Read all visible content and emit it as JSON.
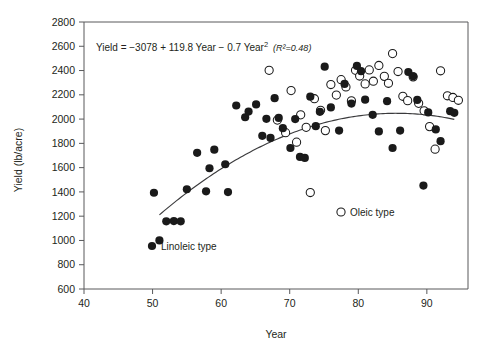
{
  "chart_data": {
    "type": "scatter",
    "title": "",
    "xlabel": "Year",
    "ylabel": "Yield (lb/acre)",
    "xlim": [
      40,
      96
    ],
    "ylim": [
      600,
      2800
    ],
    "xticks": [
      40,
      50,
      60,
      70,
      80,
      90
    ],
    "yticks": [
      600,
      800,
      1000,
      1200,
      1400,
      1600,
      1800,
      2000,
      2200,
      2400,
      2600,
      2800
    ],
    "grid": false,
    "annotation": {
      "equation": "Yield = −3078 + 119.8 Year − 0.7 Year",
      "equation_exponent": "2",
      "r_squared": "(R²=0.48)"
    },
    "legend": {
      "position": "inside-plot",
      "entries": [
        {
          "label": "Linoleic type",
          "marker": "filled-circle",
          "color": "#1a1a1a"
        },
        {
          "label": "Oleic type",
          "marker": "open-circle",
          "color": "#1a1a1a"
        }
      ]
    },
    "fit_curve": {
      "name": "Quadratic fit",
      "form": "quadratic",
      "intercept": -3078,
      "linear_coef": 119.8,
      "quadratic_coef": -0.7,
      "r_squared": 0.48,
      "x_start": 51,
      "x_end": 94
    },
    "series": [
      {
        "name": "Linoleic type",
        "marker": "filled-circle",
        "points": [
          [
            50.2,
            1393
          ],
          [
            51.0,
            1000
          ],
          [
            52.0,
            1158
          ],
          [
            53.1,
            1160
          ],
          [
            54.1,
            1158
          ],
          [
            55.0,
            1422
          ],
          [
            56.5,
            1722
          ],
          [
            57.8,
            1405
          ],
          [
            58.3,
            1595
          ],
          [
            59.0,
            1748
          ],
          [
            60.6,
            1628
          ],
          [
            61.0,
            1399
          ],
          [
            62.2,
            2112
          ],
          [
            63.5,
            2015
          ],
          [
            64.0,
            2062
          ],
          [
            65.1,
            2121
          ],
          [
            66.0,
            1862
          ],
          [
            66.6,
            2002
          ],
          [
            67.2,
            1845
          ],
          [
            67.8,
            2172
          ],
          [
            68.4,
            2010
          ],
          [
            69.0,
            1925
          ],
          [
            70.1,
            1762
          ],
          [
            70.8,
            2000
          ],
          [
            71.5,
            1688
          ],
          [
            72.2,
            1680
          ],
          [
            73.0,
            2185
          ],
          [
            73.8,
            1942
          ],
          [
            74.4,
            2060
          ],
          [
            75.1,
            2432
          ],
          [
            76.0,
            2096
          ],
          [
            77.2,
            1905
          ],
          [
            78.0,
            2290
          ],
          [
            79.0,
            2128
          ],
          [
            79.8,
            2438
          ],
          [
            80.4,
            2395
          ],
          [
            81.0,
            2160
          ],
          [
            82.1,
            2035
          ],
          [
            83.0,
            1898
          ],
          [
            84.2,
            2148
          ],
          [
            85.0,
            1762
          ],
          [
            86.1,
            1905
          ],
          [
            87.3,
            2388
          ],
          [
            88.0,
            2352
          ],
          [
            88.6,
            2158
          ],
          [
            89.5,
            1452
          ],
          [
            90.2,
            2055
          ],
          [
            91.3,
            1915
          ],
          [
            92.0,
            1818
          ],
          [
            93.4,
            2065
          ],
          [
            94.0,
            2052
          ]
        ]
      },
      {
        "name": "Oleic type",
        "marker": "open-circle",
        "points": [
          [
            67.0,
            2402
          ],
          [
            68.2,
            1992
          ],
          [
            69.4,
            1888
          ],
          [
            70.2,
            2235
          ],
          [
            71.0,
            1810
          ],
          [
            71.6,
            2035
          ],
          [
            72.4,
            1932
          ],
          [
            73.0,
            1395
          ],
          [
            73.6,
            2168
          ],
          [
            74.5,
            2072
          ],
          [
            75.2,
            1905
          ],
          [
            76.0,
            2285
          ],
          [
            76.8,
            2198
          ],
          [
            77.5,
            2325
          ],
          [
            78.2,
            2265
          ],
          [
            79.0,
            2150
          ],
          [
            79.6,
            2402
          ],
          [
            80.2,
            2355
          ],
          [
            81.0,
            2290
          ],
          [
            81.6,
            2405
          ],
          [
            82.2,
            2312
          ],
          [
            83.0,
            2442
          ],
          [
            83.8,
            2352
          ],
          [
            84.4,
            2295
          ],
          [
            85.0,
            2540
          ],
          [
            85.8,
            2392
          ],
          [
            86.5,
            2188
          ],
          [
            87.2,
            2152
          ],
          [
            88.0,
            2348
          ],
          [
            88.8,
            2130
          ],
          [
            89.6,
            2068
          ],
          [
            90.4,
            1938
          ],
          [
            91.2,
            1752
          ],
          [
            92.0,
            2398
          ],
          [
            93.0,
            2192
          ],
          [
            93.8,
            2178
          ],
          [
            94.6,
            2155
          ]
        ]
      }
    ]
  },
  "axes": {
    "x_title": "Year",
    "y_title": "Yield (lb/acre)"
  }
}
